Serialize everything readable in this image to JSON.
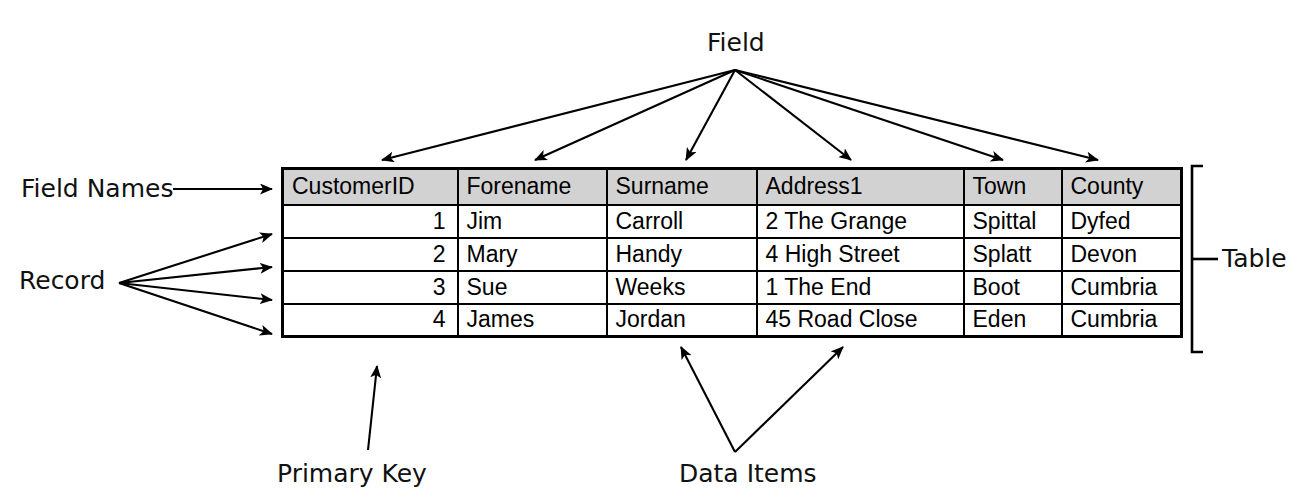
{
  "diagram": {
    "title_visible": false,
    "annotations": {
      "field": "Field",
      "field_names": "Field Names",
      "record": "Record",
      "table": "Table",
      "primary_key": "Primary Key",
      "data_items": "Data Items"
    },
    "colors": {
      "header_fill": "#d2d2d2",
      "cell_fill": "#ffffff",
      "line": "#000000",
      "text": "#111111"
    }
  },
  "table": {
    "columns": [
      {
        "key": "customer_id",
        "label": "CustomerID",
        "align": "right"
      },
      {
        "key": "forename",
        "label": "Forename",
        "align": "left"
      },
      {
        "key": "surname",
        "label": "Surname",
        "align": "left"
      },
      {
        "key": "address1",
        "label": "Address1",
        "align": "left"
      },
      {
        "key": "town",
        "label": "Town",
        "align": "left"
      },
      {
        "key": "county",
        "label": "County",
        "align": "left"
      }
    ],
    "rows": [
      {
        "customer_id": "1",
        "forename": "Jim",
        "surname": "Carroll",
        "address1": "2 The Grange",
        "town": "Spittal",
        "county": "Dyfed"
      },
      {
        "customer_id": "2",
        "forename": "Mary",
        "surname": "Handy",
        "address1": "4 High Street",
        "town": "Splatt",
        "county": "Devon"
      },
      {
        "customer_id": "3",
        "forename": "Sue",
        "surname": "Weeks",
        "address1": "1 The End",
        "town": "Boot",
        "county": "Cumbria"
      },
      {
        "customer_id": "4",
        "forename": "James",
        "surname": "Jordan",
        "address1": "45 Road Close",
        "town": "Eden",
        "county": "Cumbria"
      }
    ]
  }
}
